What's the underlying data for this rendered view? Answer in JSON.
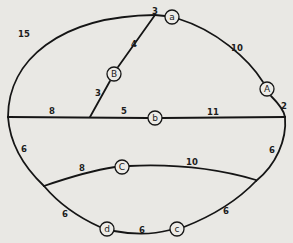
{
  "diagram": {
    "type": "weighted-graph",
    "nodes": [
      {
        "id": "a",
        "label": "a",
        "x": 172,
        "y": 17
      },
      {
        "id": "A",
        "label": "A",
        "x": 267,
        "y": 89
      },
      {
        "id": "B",
        "label": "B",
        "x": 114,
        "y": 74
      },
      {
        "id": "b",
        "label": "b",
        "x": 155,
        "y": 118
      },
      {
        "id": "C",
        "label": "C",
        "x": 122,
        "y": 167
      },
      {
        "id": "c",
        "label": "c",
        "x": 177,
        "y": 229
      },
      {
        "id": "d",
        "label": "d",
        "x": 107,
        "y": 229
      }
    ],
    "edge_weights": [
      {
        "id": "w-left-top-arc",
        "label": "15",
        "x": 24,
        "y": 34
      },
      {
        "id": "w-top-to-a",
        "label": "3",
        "x": 155,
        "y": 11
      },
      {
        "id": "w-a-to-A",
        "label": "10",
        "x": 237,
        "y": 48
      },
      {
        "id": "w-A-to-right",
        "label": "2",
        "x": 284,
        "y": 106
      },
      {
        "id": "w-B-upper",
        "label": "4",
        "x": 134,
        "y": 44
      },
      {
        "id": "w-B-lower",
        "label": "3",
        "x": 98,
        "y": 93
      },
      {
        "id": "w-mid-left",
        "label": "8",
        "x": 52,
        "y": 111
      },
      {
        "id": "w-mid-to-b",
        "label": "5",
        "x": 124,
        "y": 111
      },
      {
        "id": "w-b-to-right",
        "label": "11",
        "x": 213,
        "y": 112
      },
      {
        "id": "w-left-lower-arc",
        "label": "6",
        "x": 24,
        "y": 149
      },
      {
        "id": "w-right-lower-arc",
        "label": "6",
        "x": 272,
        "y": 150
      },
      {
        "id": "w-chord-to-C",
        "label": "8",
        "x": 82,
        "y": 168
      },
      {
        "id": "w-C-to-chord",
        "label": "10",
        "x": 192,
        "y": 162
      },
      {
        "id": "w-arc-to-d",
        "label": "6",
        "x": 65,
        "y": 214
      },
      {
        "id": "w-d-to-c",
        "label": "6",
        "x": 142,
        "y": 230
      },
      {
        "id": "w-c-to-arc",
        "label": "6",
        "x": 226,
        "y": 211
      }
    ]
  }
}
